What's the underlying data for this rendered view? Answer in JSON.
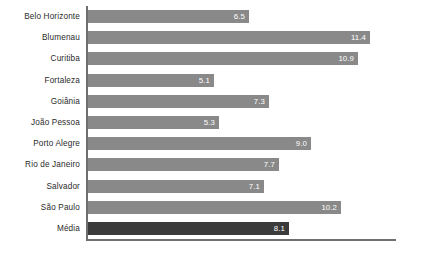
{
  "chart_data": {
    "type": "bar",
    "orientation": "horizontal",
    "title": "",
    "subtitle": "",
    "xlabel": "",
    "ylabel": "",
    "grid": false,
    "legend": false,
    "legend_position": "none",
    "xlim": [
      0,
      12.4
    ],
    "categories": [
      "Belo Horizonte",
      "Blumenau",
      "Curitiba",
      "Fortaleza",
      "Goiânia",
      "João Pessoa",
      "Porto Alegre",
      "Rio de Janeiro",
      "Salvador",
      "São Paulo",
      "Média"
    ],
    "values": [
      6.5,
      11.4,
      10.9,
      5.1,
      7.3,
      5.3,
      9.0,
      7.7,
      7.1,
      10.2,
      8.1
    ],
    "value_labels": [
      "6.5",
      "11.4",
      "10.9",
      "5.1",
      "7.3",
      "5.3",
      "9.0",
      "7.7",
      "7.1",
      "10.2",
      "8.1"
    ],
    "highlight_index": 10,
    "colors": {
      "bar": "#898989",
      "bar_highlight": "#3b3b3b",
      "axis": "#6f6f6f",
      "label_text": "#2b2b2b",
      "value_text": "#ffffff",
      "background": "#ffffff"
    }
  }
}
